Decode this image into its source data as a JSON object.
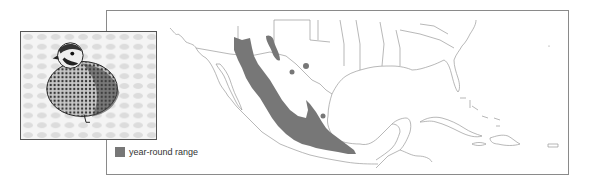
{
  "legend": {
    "items": [
      {
        "label": "year-round range",
        "color": "#777777"
      }
    ]
  },
  "illustration": {
    "subject": "quail-illustration"
  },
  "map": {
    "region": "Southwestern United States, Mexico, Gulf of Mexico, Caribbean",
    "range_color": "#777777",
    "line_color": "#999999"
  }
}
